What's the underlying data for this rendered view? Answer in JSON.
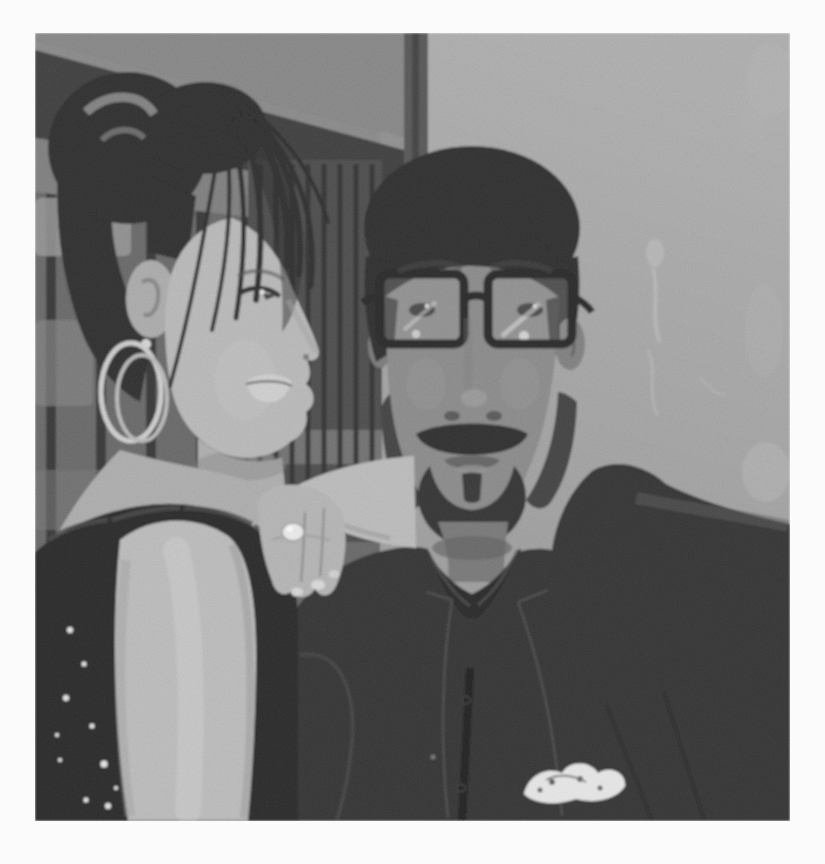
{
  "image": {
    "kind": "black-and-white photograph",
    "description": "Grainy black-and-white snapshot of a young woman with an updo and hoop earrings leaning beside a bearded man who wears thick dark rectangular glasses and a dark suit with a white patterned pocket square, posed indoors against a gray wall and dark wooden door frame; the print has a white border.",
    "finish": "grainy scanned print, soft focus, white border",
    "text_visible": "none"
  },
  "canvas": {
    "width": 825,
    "height": 864,
    "photo_left": 35,
    "photo_top": 33,
    "photo_width": 755,
    "photo_height": 788
  },
  "subjects": {
    "woman": {
      "position": "left",
      "pose": "leaning beside the man, face in three-quarter profile looking right, arm draped over his shoulder with hand hanging down, other arm hanging in the foreground",
      "features": [
        "black hair in a high bun",
        "long side-swept bangs across the forehead",
        "double metal hoop earrings",
        "black sequined lace sleeveless top",
        "chunky white ring on one finger"
      ]
    },
    "man": {
      "position": "center-right",
      "pose": "facing the camera, head straight",
      "features": [
        "short black hair",
        "thick black rectangular eyeglasses with lens glare",
        "full beard, goatee and mustache",
        "dark open-collar shirt under a dark suit jacket",
        "white patterned pocket square in breast pocket"
      ]
    },
    "background": [
      "gray wall with faint smoke-like light smudges",
      "dark diagonal wooden beam across the upper left",
      "dark slatted shutter panel between the two faces",
      "vertical door-frame edge above the man's head"
    ]
  },
  "palette": {
    "page_bg": "#fbfbfb",
    "wall_top": "#a9a9a9",
    "wall_bottom": "#8e8e8e",
    "left_wall": "#5c5c5c",
    "window_bar": "#252525",
    "window_glow": "#8f8f8f",
    "top_strip": "#7e7e7e",
    "beam": "#2f2f2f",
    "beam_highlight": "#858585",
    "beam_underside": "#747474",
    "doorframe": "#4a4a4a",
    "shutter": "#3c3c3c",
    "shutter_slat": "#222222",
    "shutter_light": "#707070",
    "smudge": "#c0c0c0",
    "hair": "#1a1a1a",
    "hair_highlight": "#8a8a8a",
    "woman_skin": "#b5b5b5",
    "woman_skin_shadow": "#a9a9a9",
    "woman_chest": "#a8a8a8",
    "woman_arm": "#b8b8b8",
    "woman_lips": "#cdcdcd",
    "lace": "#161616",
    "sequin": "#e3e3e3",
    "earring": "#cccccc",
    "ring": "#ebebeb",
    "man_skin": "#828282",
    "man_neck": "#6e6e6e",
    "beard": "#232323",
    "glasses_frame": "#141414",
    "lens_tint": "#9c9c9c",
    "eye_dark": "#3b3b3b",
    "shirt": "#191919",
    "suit": "#202020",
    "suit_edge": "#383838",
    "pocket_square": "#e7e7e7",
    "pocket_pattern": "#4a4a4a"
  }
}
